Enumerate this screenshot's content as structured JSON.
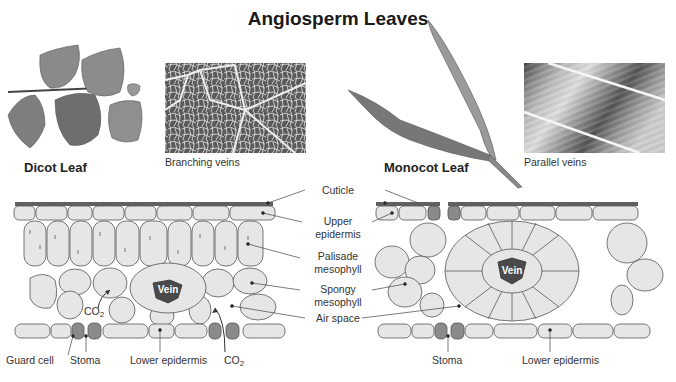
{
  "title": "Angiosperm Leaves",
  "dicot": {
    "leaf_label": "Dicot Leaf",
    "vein_caption": "Branching veins",
    "cross_section_labels": {
      "co2_upper": "CO",
      "co2_upper_sub": "2",
      "co2_lower": "CO",
      "co2_lower_sub": "2",
      "vein": "Vein",
      "guard_cell": "Guard cell",
      "stoma": "Stoma",
      "lower_epidermis": "Lower epidermis"
    }
  },
  "monocot": {
    "leaf_label": "Monocot Leaf",
    "vein_caption": "Parallel veins",
    "cross_section_labels": {
      "vein": "Vein",
      "stoma": "Stoma",
      "lower_epidermis": "Lower epidermis"
    }
  },
  "center_labels": {
    "cuticle": "Cuticle",
    "upper_epidermis_1": "Upper",
    "upper_epidermis_2": "epidermis",
    "palisade_1": "Palisade",
    "palisade_2": "mesophyll",
    "spongy_1": "Spongy",
    "spongy_2": "mesophyll",
    "air_space": "Air space"
  },
  "colors": {
    "cell_fill": "#e6e6e6",
    "cell_stroke": "#555555",
    "cuticle": "#555555",
    "vein": "#4a4a4a",
    "guard_cell": "#8a8a8a"
  }
}
